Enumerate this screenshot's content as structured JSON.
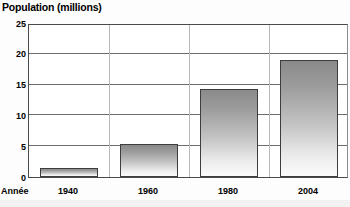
{
  "chart_data": {
    "type": "bar",
    "title": "Population (millions)",
    "xlabel": "Année",
    "ylabel": "Population (millions)",
    "categories": [
      "1940",
      "1960",
      "1980",
      "2004"
    ],
    "values": [
      1.5,
      5.3,
      14.3,
      19.0
    ],
    "ylim": [
      0,
      25
    ],
    "yticks": [
      "0",
      "5",
      "10",
      "15",
      "20",
      "25"
    ],
    "ytick_values": [
      0,
      5,
      10,
      15,
      20,
      25
    ],
    "grid": true,
    "legend": "none",
    "bar_fill_top_color": "#8a8a8a",
    "bar_fill_bottom_color": "#fbfbfb",
    "bar_border_color": "#3d3d3d",
    "axis_color": "#4a4a4a",
    "gridline_color": "#6b6b6b",
    "text_color": "#000000"
  },
  "axis": {
    "x_name_label": "Année"
  }
}
